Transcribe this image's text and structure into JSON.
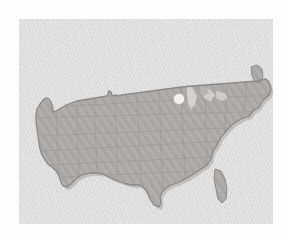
{
  "figure": {
    "type": "map",
    "region": "Contiguous United States",
    "projection_note": "simplified outline"
  },
  "panel": {
    "background_color": "#dedede",
    "outer_background_color": "#ffffff",
    "left": 19,
    "top": 19,
    "width": 254,
    "height": 205
  },
  "map": {
    "fill_color": "#aeaaa8",
    "border_color": "#8d8986",
    "state_line_color": "#9d9996",
    "shadow_color": "#b9b5b2",
    "texture": "diagonal-hatch",
    "state_borders_visible": true
  },
  "markers": [
    {
      "name": "location-marker",
      "shape": "circle",
      "color": "#f4f3f1",
      "x": 179,
      "y": 99,
      "radius": 5,
      "region_hint": "Upper Midwest / Lake Michigan"
    }
  ],
  "labels": {
    "has_text_labels": false,
    "has_legend": false,
    "has_title_text": false,
    "has_axis": false
  }
}
